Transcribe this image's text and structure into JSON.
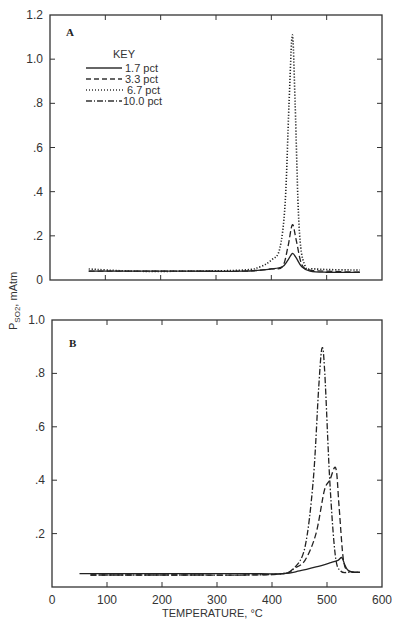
{
  "chart_data": [
    {
      "type": "line",
      "panel": "A",
      "xlabel": "TEMPERATURE, °C",
      "ylabel": "P SO2, mAtm",
      "xlim": [
        0,
        600
      ],
      "ylim": [
        0,
        1.2
      ],
      "x_ticks": [
        0,
        100,
        200,
        300,
        400,
        500,
        600
      ],
      "y_ticks": [
        "0",
        ".2",
        ".4",
        ".6",
        ".8",
        "1.0",
        "1.2"
      ],
      "legend_title": "KEY",
      "legend_position": "upper-left",
      "series": [
        {
          "name": "1.7 pct",
          "style": "solid",
          "x": [
            70,
            150,
            250,
            350,
            400,
            420,
            430,
            438,
            445,
            455,
            470,
            500,
            560
          ],
          "y": [
            0.04,
            0.04,
            0.04,
            0.04,
            0.05,
            0.06,
            0.09,
            0.12,
            0.1,
            0.06,
            0.04,
            0.035,
            0.035
          ]
        },
        {
          "name": "3.3 pct",
          "style": "dashed",
          "x": [
            70,
            150,
            250,
            350,
            400,
            420,
            430,
            438,
            445,
            455,
            470,
            500,
            560
          ],
          "y": [
            0.04,
            0.04,
            0.04,
            0.04,
            0.05,
            0.06,
            0.15,
            0.25,
            0.18,
            0.07,
            0.045,
            0.04,
            0.035
          ]
        },
        {
          "name": "6.7 pct",
          "style": "dotted",
          "x": [
            70,
            150,
            250,
            350,
            380,
            400,
            415,
            425,
            432,
            438,
            443,
            450,
            460,
            480,
            560
          ],
          "y": [
            0.05,
            0.04,
            0.04,
            0.045,
            0.06,
            0.09,
            0.14,
            0.35,
            0.8,
            1.11,
            0.8,
            0.25,
            0.07,
            0.05,
            0.045
          ]
        },
        {
          "name": "10.0 pct",
          "style": "dash-dot",
          "x": [],
          "y": []
        }
      ]
    },
    {
      "type": "line",
      "panel": "B",
      "xlabel": "TEMPERATURE, °C",
      "ylabel": "P SO2, mAtm",
      "xlim": [
        0,
        600
      ],
      "ylim": [
        0,
        1.0
      ],
      "x_ticks": [
        0,
        100,
        200,
        300,
        400,
        500,
        600
      ],
      "y_ticks": [
        ".2",
        ".4",
        ".6",
        ".8",
        "1.0"
      ],
      "series": [
        {
          "name": "1.7 pct",
          "style": "solid",
          "x": [
            50,
            150,
            250,
            350,
            420,
            450,
            480,
            505,
            520,
            527,
            533,
            540,
            560
          ],
          "y": [
            0.05,
            0.05,
            0.05,
            0.05,
            0.05,
            0.06,
            0.075,
            0.09,
            0.1,
            0.11,
            0.08,
            0.06,
            0.055
          ]
        },
        {
          "name": "3.3 pct",
          "style": "dashed",
          "x": [
            70,
            150,
            250,
            350,
            420,
            440,
            460,
            480,
            495,
            505,
            516,
            522,
            530,
            540,
            560
          ],
          "y": [
            0.045,
            0.045,
            0.045,
            0.045,
            0.05,
            0.07,
            0.1,
            0.2,
            0.36,
            0.4,
            0.445,
            0.3,
            0.1,
            0.06,
            0.055
          ]
        },
        {
          "name": "6.7 pct",
          "style": "dotted",
          "x": [],
          "y": []
        },
        {
          "name": "10.0 pct",
          "style": "dash-dot",
          "x": [
            70,
            150,
            250,
            350,
            420,
            440,
            460,
            475,
            485,
            491,
            496,
            505,
            515,
            525,
            540,
            560
          ],
          "y": [
            0.045,
            0.045,
            0.045,
            0.045,
            0.05,
            0.07,
            0.15,
            0.4,
            0.75,
            0.895,
            0.8,
            0.4,
            0.12,
            0.06,
            0.055,
            0.055
          ]
        }
      ]
    }
  ],
  "panels": {
    "a": {
      "label": "A"
    },
    "b": {
      "label": "B"
    }
  },
  "legend": {
    "title": "KEY",
    "items": [
      "1.7 pct",
      "3.3 pct",
      "6.7 pct",
      "10.0 pct"
    ]
  },
  "axes": {
    "ylabel": "P",
    "ylabel_sub": "SO2",
    "ylabel_unit": ", mAtm",
    "xlabel": "TEMPERATURE, °C",
    "x_ticks": [
      "0",
      "100",
      "200",
      "300",
      "400",
      "500",
      "600"
    ],
    "a_y_ticks": [
      "0",
      ".2",
      ".4",
      ".6",
      ".8",
      "1.0",
      "1.2"
    ],
    "b_y_ticks": [
      ".2",
      ".4",
      ".6",
      ".8",
      "1.0"
    ]
  }
}
